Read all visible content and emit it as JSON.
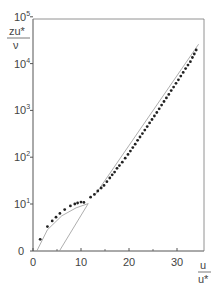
{
  "chart_data": {
    "type": "scatter",
    "title": "",
    "xlabel": "u/u*",
    "ylabel": "zu*/ν",
    "xscale": "linear",
    "yscale": "log (with 0 at origin)",
    "xlim": [
      0,
      35
    ],
    "ylim": [
      0,
      100000
    ],
    "grid": false,
    "legend": null,
    "x_ticks": [
      {
        "value": 0,
        "label": "0"
      },
      {
        "value": 10,
        "label": "10"
      },
      {
        "value": 20,
        "label": "20"
      },
      {
        "value": 30,
        "label": "30"
      }
    ],
    "x_minor_ticks": [
      5,
      15,
      25
    ],
    "y_ticks": [
      {
        "value": 0,
        "label": "0",
        "exp": ""
      },
      {
        "value": 10,
        "label": "10",
        "exp": "1"
      },
      {
        "value": 100,
        "label": "10",
        "exp": "2"
      },
      {
        "value": 1000,
        "label": "10",
        "exp": "3"
      },
      {
        "value": 10000,
        "label": "10",
        "exp": "4"
      },
      {
        "value": 100000,
        "label": "10",
        "exp": "5"
      }
    ],
    "series": [
      {
        "name": "measured profile",
        "kind": "points",
        "points": [
          [
            1.5,
            2.5
          ],
          [
            3.0,
            5.2
          ],
          [
            4.0,
            6.4
          ],
          [
            4.8,
            7.2
          ],
          [
            5.6,
            8.0
          ],
          [
            6.6,
            8.8
          ],
          [
            7.8,
            9.6
          ],
          [
            8.7,
            10.0
          ],
          [
            9.3,
            10.5
          ],
          [
            10.0,
            11.0
          ],
          [
            10.6,
            10.8
          ],
          [
            12.0,
            14
          ],
          [
            12.8,
            16
          ],
          [
            13.5,
            19
          ],
          [
            14.2,
            22
          ],
          [
            14.8,
            25
          ],
          [
            15.4,
            30
          ],
          [
            16.0,
            36
          ],
          [
            16.5,
            42
          ],
          [
            17.0,
            48
          ],
          [
            17.5,
            58
          ],
          [
            18.0,
            66
          ],
          [
            18.6,
            78
          ],
          [
            19.2,
            95
          ],
          [
            19.8,
            115
          ],
          [
            20.3,
            135
          ],
          [
            20.8,
            160
          ],
          [
            21.3,
            190
          ],
          [
            21.8,
            230
          ],
          [
            22.3,
            270
          ],
          [
            22.8,
            320
          ],
          [
            23.3,
            380
          ],
          [
            23.8,
            450
          ],
          [
            24.3,
            540
          ],
          [
            24.8,
            640
          ],
          [
            25.3,
            760
          ],
          [
            25.8,
            900
          ],
          [
            26.3,
            1080
          ],
          [
            26.8,
            1300
          ],
          [
            27.3,
            1550
          ],
          [
            27.8,
            1850
          ],
          [
            28.3,
            2200
          ],
          [
            28.8,
            2650
          ],
          [
            29.3,
            3150
          ],
          [
            29.8,
            3800
          ],
          [
            30.3,
            4500
          ],
          [
            30.8,
            5400
          ],
          [
            31.3,
            6500
          ],
          [
            31.8,
            7800
          ],
          [
            32.3,
            9300
          ],
          [
            32.8,
            11000
          ],
          [
            33.2,
            13500
          ],
          [
            33.6,
            16000
          ],
          [
            34.0,
            19500
          ]
        ]
      },
      {
        "name": "viscous sublayer curve",
        "kind": "line",
        "points": [
          [
            0.8,
            0
          ],
          [
            3,
            4.5
          ],
          [
            6,
            7.5
          ],
          [
            9,
            9.2
          ],
          [
            11.5,
            10.2
          ]
        ]
      },
      {
        "name": "linear sublayer line",
        "kind": "line",
        "points": [
          [
            5.5,
            0
          ],
          [
            11.5,
            10.2
          ]
        ]
      },
      {
        "name": "log law line",
        "kind": "line",
        "points": [
          [
            13.0,
            16
          ],
          [
            34.5,
            26000
          ]
        ]
      }
    ]
  },
  "labels": {
    "y_axis_num": "zu*",
    "y_axis_den": "ν",
    "x_axis_num": "u",
    "x_axis_den": "u*"
  }
}
